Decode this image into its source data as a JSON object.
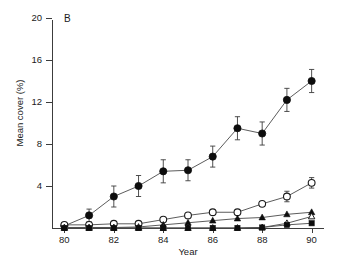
{
  "panel": {
    "label": "B"
  },
  "axes": {
    "y_title": "Mean cover (%)",
    "x_title": "Year",
    "y_ticks": [
      "4",
      "8",
      "12",
      "16",
      "20"
    ],
    "x_ticks": [
      "80",
      "82",
      "84",
      "86",
      "88",
      "90"
    ]
  },
  "chart_data": {
    "type": "line",
    "title": "B",
    "xlabel": "Year",
    "ylabel": "Mean cover (%)",
    "xlim": [
      79.5,
      90.5
    ],
    "ylim": [
      0,
      21
    ],
    "ytick_values": [
      4,
      8,
      12,
      16,
      20
    ],
    "xtick_values": [
      80,
      82,
      84,
      86,
      88,
      90
    ],
    "grid": false,
    "legend": "none",
    "x": [
      80,
      81,
      82,
      83,
      84,
      85,
      86,
      87,
      88,
      89,
      90
    ],
    "series": [
      {
        "name": "filled-circle",
        "marker": "filled circle",
        "values": [
          0.2,
          1.2,
          3.0,
          4.0,
          5.4,
          5.5,
          6.8,
          9.5,
          9.0,
          12.2,
          14.0
        ],
        "errors": [
          0.3,
          0.6,
          1.0,
          1.0,
          1.1,
          1.0,
          1.0,
          1.1,
          1.1,
          1.1,
          1.1
        ]
      },
      {
        "name": "open-circle",
        "marker": "open circle",
        "values": [
          0.3,
          0.3,
          0.4,
          0.4,
          0.8,
          1.2,
          1.5,
          1.5,
          2.3,
          3.0,
          4.3
        ],
        "errors": [
          0,
          0,
          0,
          0,
          0,
          0,
          0,
          0,
          0,
          0.5,
          0.5
        ]
      },
      {
        "name": "filled-triangle",
        "marker": "filled triangle",
        "values": [
          0.05,
          0.05,
          0.05,
          0.1,
          0.3,
          0.5,
          0.7,
          0.9,
          1.0,
          1.3,
          1.5
        ],
        "errors": [
          0,
          0,
          0,
          0,
          0,
          0,
          0,
          0,
          0,
          0,
          0
        ]
      },
      {
        "name": "open-triangle",
        "marker": "open triangle",
        "values": [
          0.0,
          0.0,
          0.0,
          0.0,
          0.0,
          0.0,
          0.0,
          0.0,
          0.05,
          0.45,
          1.1
        ],
        "errors": [
          0,
          0,
          0,
          0,
          0,
          0,
          0,
          0,
          0,
          0,
          0
        ]
      },
      {
        "name": "filled-square",
        "marker": "filled square",
        "values": [
          0.0,
          0.0,
          0.0,
          0.0,
          0.0,
          0.0,
          0.0,
          0.0,
          0.05,
          0.3,
          0.45
        ],
        "errors": [
          0,
          0,
          0,
          0,
          0,
          0,
          0,
          0,
          0,
          0,
          0
        ]
      }
    ]
  }
}
